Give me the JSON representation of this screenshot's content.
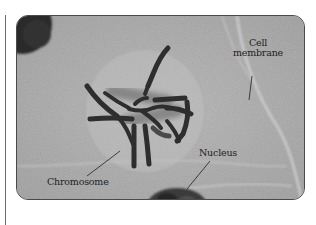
{
  "figure": {
    "type": "labeled-micrograph",
    "labels": {
      "cell_membrane_line1": "Cell",
      "cell_membrane_line2": "membrane",
      "nucleus": "Nucleus",
      "chromosome": "Chromosome"
    }
  },
  "colors": {
    "background": "#b4b4b4",
    "frame_border": "#4a4a4a",
    "chromosome": "#2e2e2e",
    "label_text": "#1e1e1e"
  }
}
